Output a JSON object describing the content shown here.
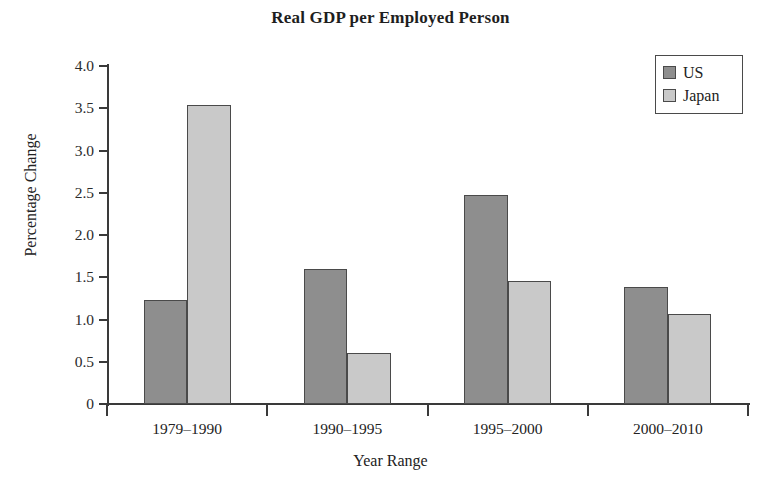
{
  "chart_data": {
    "type": "bar",
    "title": "Real GDP per Employed Person",
    "xlabel": "Year Range",
    "ylabel": "Percentage Change",
    "categories": [
      "1979–1990",
      "1990–1995",
      "1995–2000",
      "2000–2010"
    ],
    "series": [
      {
        "name": "US",
        "color": "#8e8e8e",
        "values": [
          1.23,
          1.6,
          2.47,
          1.39
        ]
      },
      {
        "name": "Japan",
        "color": "#c9c9c9",
        "values": [
          3.54,
          0.6,
          1.45,
          1.07
        ]
      }
    ],
    "ylim": [
      0,
      4.0
    ],
    "ytick_labels": [
      "0",
      "0.5",
      "1.0",
      "1.5",
      "2.0",
      "2.5",
      "3.0",
      "3.5",
      "4.0"
    ],
    "ytick_values": [
      0,
      0.5,
      1.0,
      1.5,
      2.0,
      2.5,
      3.0,
      3.5,
      4.0
    ],
    "grid": false,
    "legend_position": "top-right",
    "legend_entries": [
      "US",
      "Japan"
    ]
  },
  "legend": {
    "items": [
      {
        "label": "US",
        "color": "#8e8e8e"
      },
      {
        "label": "Japan",
        "color": "#c9c9c9"
      }
    ]
  }
}
